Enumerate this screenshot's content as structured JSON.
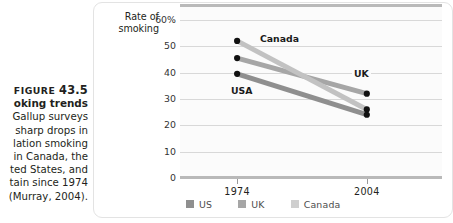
{
  "figure": {
    "label_word": "FIGURE",
    "number": "43.5",
    "title": "oking trends",
    "body_lines": [
      "Gallup surveys",
      "sharp drops in",
      "lation smoking",
      "in Canada, the",
      "ted States, and",
      "tain since 1974",
      "(Murray, 2004)."
    ]
  },
  "chart_data": {
    "type": "line",
    "title": "",
    "subtitle": "",
    "xlabel": "",
    "ylabel": "Rate of smoking",
    "ylabel_line1": "Rate of",
    "ylabel_line2": "smoking",
    "categories": [
      "1974",
      "2004"
    ],
    "x_tick_labels": [
      "1974",
      "2004"
    ],
    "y_tick_labels": [
      "60%",
      "50",
      "40",
      "30",
      "20",
      "10",
      "0"
    ],
    "y_ticks": [
      60,
      50,
      40,
      30,
      20,
      10,
      0
    ],
    "ylim": [
      0,
      66
    ],
    "grid": true,
    "legend_position": "bottom",
    "series": [
      {
        "name": "US",
        "label": "USA",
        "values": [
          39.5,
          24
        ],
        "color": "#8f8f8f"
      },
      {
        "name": "UK",
        "label": "UK",
        "values": [
          45.5,
          32
        ],
        "color": "#a6a6a6"
      },
      {
        "name": "Canada",
        "label": "Canada",
        "values": [
          52,
          26
        ],
        "color": "#c2c2c2"
      }
    ],
    "annotations": [
      "Canada",
      "UK",
      "USA"
    ],
    "marker_color": "#111111"
  },
  "legend": {
    "items": [
      {
        "label": "US",
        "color": "#8f8f8f"
      },
      {
        "label": "UK",
        "color": "#a6a6a6"
      },
      {
        "label": "Canada",
        "color": "#cfcfcf"
      }
    ]
  },
  "colors": {
    "plot_bg": "#fbfbfb",
    "gridline": "#d8d8d8",
    "axis_heavy": "#b9b9b9",
    "text": "#231f20"
  }
}
